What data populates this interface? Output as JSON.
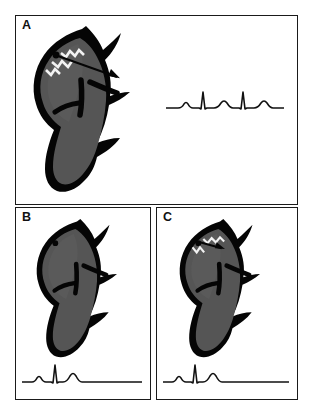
{
  "figure": {
    "background_color": "#ffffff",
    "border_color": "#1a1a1a",
    "panel_count": 3
  },
  "palette": {
    "ink": "#111111",
    "myocardium_dark": "#050505",
    "chamber_gray": "#555555",
    "chamber_gray_light": "#6b6b6b",
    "highlight_white": "#f2f2f2",
    "trace": "#111111",
    "panel_fill": "#ffffff"
  },
  "panels": [
    {
      "id": "a",
      "label": "A",
      "heart": {
        "name": "heart-diagram-a",
        "chamber_fill": "#555555",
        "wall_fill": "#050505",
        "has_focus_dot": true,
        "focus_dot_color": "#050505",
        "has_lightning": true,
        "lightning_color": "#f2f2f2",
        "lightning_count": 3,
        "has_arrow": true,
        "arrow_color": "#050505",
        "arrow_length": "long",
        "arrow_direction": "rightward-downward"
      },
      "ecg": {
        "name": "ecg-trace-a",
        "stroke_color": "#111111",
        "stroke_width": 1.6,
        "beat_count": 2,
        "rhythm": "two complete P-QRS-T complexes",
        "baseline_y": 26,
        "width": 118,
        "height": 34,
        "waveform": "M0,26 L12,26 Q16,26 18,22 Q20,19 22,22 Q24,26 27,26 L33,26 L35,27 L37,10 L39,27 L41,26 L48,26 Q52,26 55,21 Q58,17 61,21 Q64,26 67,26 L73,26 L75,27 L77,10 L79,27 L81,26 L88,26 Q92,26 95,21 Q98,17 101,21 Q104,26 107,26 L118,26"
      }
    },
    {
      "id": "b",
      "label": "B",
      "heart": {
        "name": "heart-diagram-b",
        "chamber_fill": "#555555",
        "wall_fill": "#050505",
        "has_focus_dot": true,
        "focus_dot_color": "#050505",
        "has_lightning": false,
        "lightning_color": "#f2f2f2",
        "lightning_count": 0,
        "has_arrow": false,
        "arrow_color": "#050505",
        "arrow_length": "none",
        "arrow_direction": "none"
      },
      "ecg": {
        "name": "ecg-trace-b",
        "stroke_color": "#111111",
        "stroke_width": 1.6,
        "beat_count": 1,
        "rhythm": "single P-QRS-T complex followed by flat isoelectric line",
        "baseline_y": 26,
        "width": 120,
        "height": 34,
        "waveform": "M0,26 L10,26 Q13,26 15,22 Q17,19 19,22 Q21,26 24,26 L29,26 L31,27 L33,9 L35,27 L37,26 L41,26 Q45,26 48,20 Q51,15 54,20 Q57,26 60,26 L120,26"
      }
    },
    {
      "id": "c",
      "label": "C",
      "heart": {
        "name": "heart-diagram-c",
        "chamber_fill": "#555555",
        "wall_fill": "#050505",
        "has_focus_dot": true,
        "focus_dot_color": "#050505",
        "has_lightning": true,
        "lightning_color": "#f2f2f2",
        "lightning_count": 2,
        "has_arrow": true,
        "arrow_color": "#050505",
        "arrow_length": "short",
        "arrow_direction": "rightward"
      },
      "ecg": {
        "name": "ecg-trace-c",
        "stroke_color": "#111111",
        "stroke_width": 1.6,
        "beat_count": 1,
        "rhythm": "single P-QRS-T complex followed by flat isoelectric line",
        "baseline_y": 26,
        "width": 126,
        "height": 34,
        "waveform": "M0,26 L9,26 Q12,26 14,22 Q16,19 18,22 Q20,26 23,26 L28,26 L30,27 L32,9 L34,27 L36,26 L40,26 Q44,26 47,20 Q50,15 53,20 Q56,26 59,26 L126,26"
      }
    }
  ]
}
